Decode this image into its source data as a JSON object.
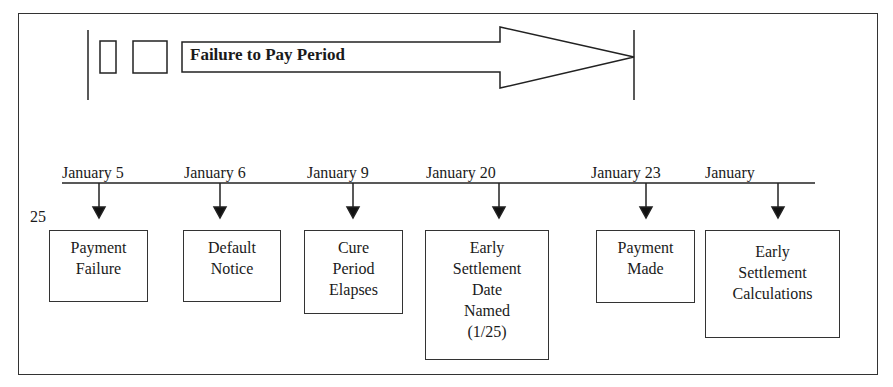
{
  "period": {
    "label": "Failure to Pay Period"
  },
  "timeline": {
    "events": [
      {
        "date": "January 5",
        "box": "Payment\nFailure"
      },
      {
        "date": "January 6",
        "box": "Default\nNotice"
      },
      {
        "date": "January 9",
        "box": "Cure\nPeriod\nElapses"
      },
      {
        "date": "January 20",
        "box": "Early\nSettlement\nDate\nNamed\n(1/25)"
      },
      {
        "date": "January 23",
        "box": "Payment\nMade"
      },
      {
        "date": "January",
        "box": "Early\nSettlement\nCalculations"
      }
    ],
    "stray_text": "25"
  },
  "colors": {
    "line": "#1a1a1a",
    "background": "#ffffff"
  }
}
